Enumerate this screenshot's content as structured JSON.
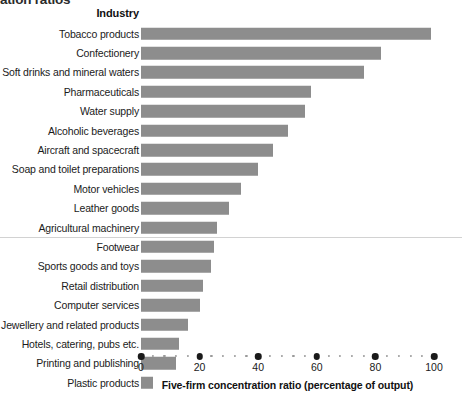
{
  "chart_title_clipped": "ation ratios",
  "category_header": "Industry",
  "axis": {
    "title": "Five-firm concentration ratio (percentage of output)",
    "tick_labels": [
      "0",
      "20",
      "40",
      "60",
      "80",
      "100"
    ],
    "tick_values": [
      0,
      20,
      40,
      60,
      80,
      100
    ],
    "minor_step": 4
  },
  "chart_data": {
    "type": "bar",
    "orientation": "horizontal",
    "title": "ation ratios",
    "xlabel": "Five-firm concentration ratio (percentage of output)",
    "ylabel": "Industry",
    "xlim": [
      0,
      100
    ],
    "grid": false,
    "legend": null,
    "bar_color": "#8d8d8d",
    "categories": [
      "Tobacco products",
      "Confectionery",
      "Soft drinks and mineral waters",
      "Pharmaceuticals",
      "Water supply",
      "Alcoholic beverages",
      "Aircraft and spacecraft",
      "Soap and toilet preparations",
      "Motor vehicles",
      "Leather goods",
      "Agricultural machinery",
      "Footwear",
      "Sports goods and toys",
      "Retail distribution",
      "Computer services",
      "Jewellery and related products",
      "Hotels, catering, pubs etc.",
      "Printing and publishing",
      "Plastic products"
    ],
    "values": [
      99,
      82,
      76,
      58,
      56,
      50,
      45,
      40,
      34,
      30,
      26,
      25,
      24,
      21,
      20,
      16,
      13,
      12,
      4
    ],
    "annotations": [
      {
        "type": "divider",
        "after_category": "Agricultural machinery"
      }
    ]
  }
}
